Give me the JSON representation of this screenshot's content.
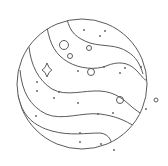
{
  "illustration": {
    "subject": "planet-line-art",
    "stroke_color": "#5a5a5a",
    "background": "#ffffff",
    "planet": {
      "cx": 82,
      "cy": 84,
      "r": 65
    },
    "bands": [
      "M67,19 C70,32 76,38 90,43 C104,47 116,44 128,52 C136,57 140,64 143,74",
      "M47,27 C50,45 56,55 68,62 C80,69 96,70 106,66 C118,61 128,62 136,70 C142,76 144,80 146,80",
      "M29,47 C31,65 38,80 52,89 C66,97 84,90 100,91 C116,92 124,100 132,107 C138,112 141,113 144,116",
      "M20,70 C22,92 30,106 46,114 C62,121 82,112 100,114 C116,116 126,121 134,126",
      "M18,95 C22,116 34,126 52,131 C70,136 86,133 100,133 C110,134 112,142 113,150"
    ],
    "rings": [
      {
        "cx": 64,
        "cy": 45,
        "r": 4.5
      },
      {
        "cx": 70,
        "cy": 56,
        "r": 2.5
      },
      {
        "cx": 89,
        "cy": 48,
        "r": 2.5
      },
      {
        "cx": 91,
        "cy": 72,
        "r": 3.5
      },
      {
        "cx": 120,
        "cy": 100,
        "r": 3.5
      },
      {
        "cx": 156,
        "cy": 100,
        "r": 2
      }
    ],
    "dots": [
      {
        "cx": 84,
        "cy": 30
      },
      {
        "cx": 105,
        "cy": 31
      },
      {
        "cx": 100,
        "cy": 36
      },
      {
        "cx": 78,
        "cy": 71
      },
      {
        "cx": 104,
        "cy": 67
      },
      {
        "cx": 120,
        "cy": 73
      },
      {
        "cx": 125,
        "cy": 68
      },
      {
        "cx": 141,
        "cy": 67
      },
      {
        "cx": 37,
        "cy": 82
      },
      {
        "cx": 37,
        "cy": 91
      },
      {
        "cx": 59,
        "cy": 92
      },
      {
        "cx": 54,
        "cy": 98
      },
      {
        "cx": 78,
        "cy": 103
      },
      {
        "cx": 36,
        "cy": 116
      },
      {
        "cx": 98,
        "cy": 114
      },
      {
        "cx": 113,
        "cy": 113
      },
      {
        "cx": 146,
        "cy": 109
      },
      {
        "cx": 80,
        "cy": 133
      },
      {
        "cx": 80,
        "cy": 142
      },
      {
        "cx": 101,
        "cy": 144
      },
      {
        "cx": 114,
        "cy": 150
      }
    ],
    "sparkle": {
      "cx": 47,
      "cy": 70,
      "size": 7
    }
  }
}
